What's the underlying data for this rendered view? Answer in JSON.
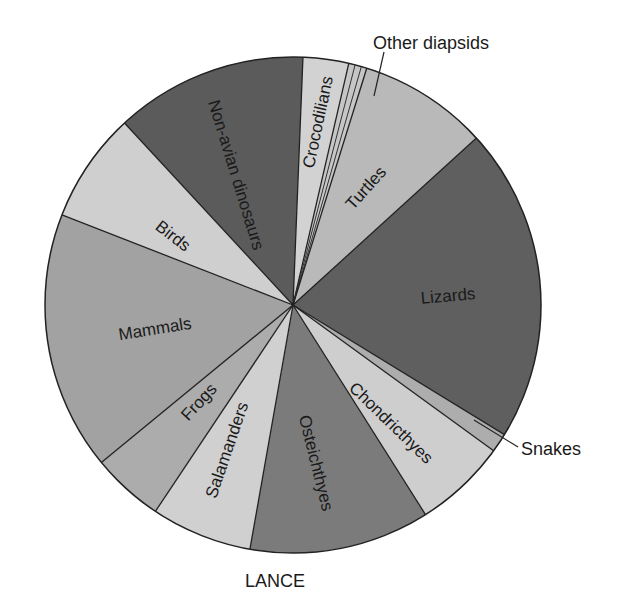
{
  "chart_data": {
    "type": "pie",
    "title": "",
    "caption": "LANCE",
    "start_angle_deg": 2.3,
    "direction": "clockwise",
    "center": [
      293,
      305
    ],
    "radius": 248,
    "slices": [
      {
        "label": "Crocodilians",
        "percent": 3.0,
        "start": 2.3,
        "end": 13.0,
        "color": "#d2d2d2",
        "label_pos": [
          318,
          122
        ],
        "label_rot": -78,
        "label_inside": true
      },
      {
        "label": "Other diapsids",
        "percent": 1.2,
        "start": 13.0,
        "end": 17.3,
        "color": "#c6c6c6",
        "label_inside": false,
        "sub_dividers": [
          14.5,
          16.0
        ]
      },
      {
        "label": "Turtles",
        "percent": 8.4,
        "start": 17.3,
        "end": 47.7,
        "color": "#b9b9b9",
        "label_pos": [
          366,
          188
        ],
        "label_rot": -48,
        "label_inside": true
      },
      {
        "label": "Lizards",
        "percent": 20.5,
        "start": 47.7,
        "end": 121.5,
        "color": "#5f5f5f",
        "label_pos": [
          448,
          296
        ],
        "label_rot": -5,
        "label_inside": true
      },
      {
        "label": "Snakes",
        "percent": 1.25,
        "start": 121.5,
        "end": 126.0,
        "color": "#adadad",
        "label_inside": false
      },
      {
        "label": "Chondricthyes",
        "percent": 6.0,
        "start": 126.0,
        "end": 147.7,
        "color": "#cecece",
        "label_pos": [
          391,
          423
        ],
        "label_rot": 44,
        "label_inside": true
      },
      {
        "label": "Osteichthyes",
        "percent": 11.8,
        "start": 147.7,
        "end": 190.0,
        "color": "#7b7b7b",
        "label_pos": [
          316,
          463
        ],
        "label_rot": 76,
        "label_inside": true
      },
      {
        "label": "Salamanders",
        "percent": 6.6,
        "start": 190.0,
        "end": 213.7,
        "color": "#d0d0d0",
        "label_pos": [
          227,
          450
        ],
        "label_rot": -71,
        "label_inside": true
      },
      {
        "label": "Frogs",
        "percent": 4.7,
        "start": 213.7,
        "end": 230.6,
        "color": "#acacac",
        "label_pos": [
          199,
          402
        ],
        "label_rot": -47,
        "label_inside": true
      },
      {
        "label": "Mammals",
        "percent": 16.9,
        "start": 230.6,
        "end": 291.3,
        "color": "#a2a2a2",
        "label_pos": [
          155,
          329
        ],
        "label_rot": -9,
        "label_inside": true
      },
      {
        "label": "Birds",
        "percent": 7.2,
        "start": 291.3,
        "end": 317.2,
        "color": "#cfcfcf",
        "label_pos": [
          173,
          236
        ],
        "label_rot": 38,
        "label_inside": true
      },
      {
        "label": "Non-avian dinosaurs",
        "percent": 12.5,
        "start": 317.2,
        "end": 362.3,
        "color": "#5b5b5b",
        "label_pos": [
          236,
          175
        ],
        "label_rot": 73,
        "label_inside": true
      }
    ],
    "outer_labels": [
      {
        "label": "Other diapsids",
        "text_pos": [
          373,
          49
        ],
        "leader": [
          [
            384,
            52
          ],
          [
            374,
            96
          ]
        ]
      },
      {
        "label": "Snakes",
        "text_pos": [
          521,
          455
        ],
        "leader": [
          [
            474,
            420
          ],
          [
            518,
            447
          ]
        ]
      }
    ],
    "legend": "none",
    "grid": false
  }
}
